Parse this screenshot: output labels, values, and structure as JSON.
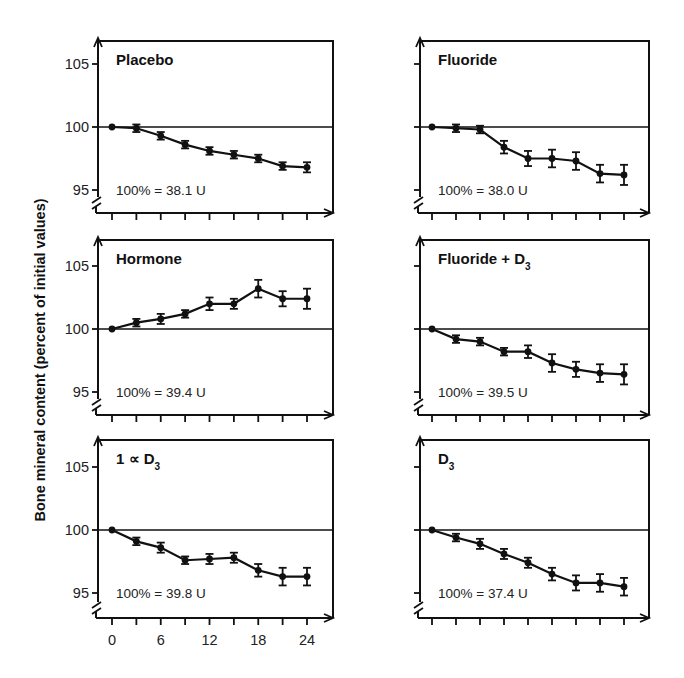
{
  "chart_data": {
    "type": "line",
    "ylabel": "Bone mineral content (percent of initial values)",
    "xlabel": "",
    "x": [
      0,
      3,
      6,
      9,
      12,
      15,
      18,
      21,
      24
    ],
    "x_tick_labels": [
      "0",
      "6",
      "12",
      "18",
      "24"
    ],
    "y_tick_labels": [
      "105",
      "100",
      "95"
    ],
    "ylim": [
      94,
      106.5
    ],
    "xlim": [
      0,
      24
    ],
    "reference_line": 100,
    "grid": false,
    "layout": "3x2 panels",
    "panels": [
      {
        "title": "Placebo",
        "title_sub": "",
        "note": "100% = 38.1 U",
        "values": [
          100,
          99.9,
          99.3,
          98.6,
          98.1,
          97.8,
          97.5,
          96.9,
          96.8
        ],
        "errors": [
          0,
          0.3,
          0.3,
          0.3,
          0.3,
          0.3,
          0.3,
          0.3,
          0.4
        ]
      },
      {
        "title": "Fluoride",
        "title_sub": "",
        "note": "100% = 38.0 U",
        "values": [
          100,
          99.9,
          99.8,
          98.4,
          97.5,
          97.5,
          97.3,
          96.3,
          96.2
        ],
        "errors": [
          0,
          0.3,
          0.3,
          0.5,
          0.6,
          0.7,
          0.7,
          0.7,
          0.8
        ]
      },
      {
        "title": "Hormone",
        "title_sub": "",
        "note": "100% = 39.4 U",
        "values": [
          100,
          100.5,
          100.8,
          101.2,
          102.0,
          102.0,
          103.2,
          102.4,
          102.4
        ],
        "errors": [
          0,
          0.3,
          0.4,
          0.3,
          0.5,
          0.4,
          0.7,
          0.6,
          0.8
        ]
      },
      {
        "title": "Fluoride + D",
        "title_sub": "3",
        "note": "100% = 39.5 U",
        "values": [
          100,
          99.2,
          99.0,
          98.2,
          98.2,
          97.3,
          96.8,
          96.5,
          96.4
        ],
        "errors": [
          0,
          0.3,
          0.3,
          0.3,
          0.5,
          0.7,
          0.6,
          0.7,
          0.8
        ]
      },
      {
        "title": "1 ∝ D",
        "title_sub": "3",
        "note": "100% = 39.8 U",
        "values": [
          100,
          99.1,
          98.6,
          97.6,
          97.7,
          97.8,
          96.8,
          96.3,
          96.3
        ],
        "errors": [
          0,
          0.3,
          0.4,
          0.3,
          0.4,
          0.4,
          0.5,
          0.7,
          0.7
        ]
      },
      {
        "title": "D",
        "title_sub": "3",
        "note": "100% = 37.4 U",
        "values": [
          100,
          99.4,
          98.9,
          98.1,
          97.4,
          96.5,
          95.8,
          95.8,
          95.5
        ],
        "errors": [
          0,
          0.3,
          0.4,
          0.4,
          0.4,
          0.5,
          0.6,
          0.7,
          0.7
        ]
      }
    ]
  },
  "colors": {
    "ink": "#111111",
    "background": "#ffffff"
  }
}
